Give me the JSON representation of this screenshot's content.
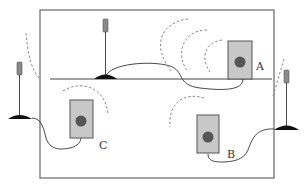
{
  "diagram": {
    "colors": {
      "background": "#ffffff",
      "stroke": "#555555",
      "device_fill": "#c8c8c8",
      "device_dot": "#555555",
      "antenna_head": "#8a8a8a",
      "wave": "#888888",
      "base": "#111111"
    },
    "devices": [
      {
        "id": "A",
        "label": "A"
      },
      {
        "id": "B",
        "label": "B"
      },
      {
        "id": "C",
        "label": "C"
      }
    ],
    "antennas": [
      {
        "id": "top-center",
        "position": "on inner horizontal line"
      },
      {
        "id": "left-outside",
        "position": "outside left wall"
      },
      {
        "id": "right-outside",
        "position": "outside right wall"
      }
    ]
  }
}
